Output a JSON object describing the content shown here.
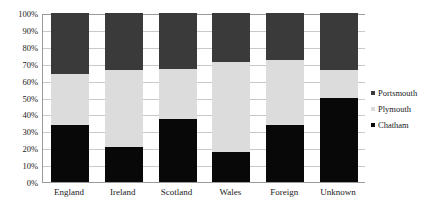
{
  "chart_data": {
    "type": "bar",
    "subtype": "stacked-100-percent",
    "title": "",
    "xlabel": "",
    "ylabel": "",
    "ylim": [
      0,
      100
    ],
    "grid": true,
    "legend_position": "right",
    "categories": [
      "England",
      "Ireland",
      "Scotland",
      "Wales",
      "Foreign",
      "Unknown"
    ],
    "series": [
      {
        "name": "Chatham",
        "color": "#080808",
        "values": [
          34,
          21,
          37,
          18,
          34,
          50
        ]
      },
      {
        "name": "Plymouth",
        "color": "#dcdcdc",
        "values": [
          30,
          45,
          30,
          53,
          38,
          16
        ]
      },
      {
        "name": "Portsmouth",
        "color": "#3a3a3a",
        "values": [
          36,
          34,
          33,
          29,
          28,
          34
        ]
      }
    ],
    "y_ticks": [
      "0%",
      "10%",
      "20%",
      "30%",
      "40%",
      "50%",
      "60%",
      "70%",
      "80%",
      "90%",
      "100%"
    ],
    "y_tick_values": [
      0,
      10,
      20,
      30,
      40,
      50,
      60,
      70,
      80,
      90,
      100
    ],
    "stack_tops": {
      "England": {
        "chatham": 34,
        "plymouth": 64,
        "portsmouth": 100
      },
      "Ireland": {
        "chatham": 21,
        "plymouth": 66,
        "portsmouth": 100
      },
      "Scotland": {
        "chatham": 37,
        "plymouth": 67,
        "portsmouth": 100
      },
      "Wales": {
        "chatham": 18,
        "plymouth": 71,
        "portsmouth": 100
      },
      "Foreign": {
        "chatham": 34,
        "plymouth": 72,
        "portsmouth": 100
      },
      "Unknown": {
        "chatham": 50,
        "plymouth": 66,
        "portsmouth": 100
      }
    }
  },
  "legend": {
    "items": [
      {
        "label": "Portsmouth",
        "color": "#3a3a3a",
        "marker": "square-marker"
      },
      {
        "label": "Plymouth",
        "color": "#dcdcdc",
        "marker": "square-marker"
      },
      {
        "label": "Chatham",
        "color": "#080808",
        "marker": "square-marker"
      }
    ]
  },
  "colors": {
    "chatham": "#080808",
    "plymouth": "#dcdcdc",
    "portsmouth": "#3a3a3a",
    "gridline": "#c9c9c9",
    "axis": "#9a9a9a",
    "text": "#1a1a1a",
    "background": "#ffffff"
  }
}
